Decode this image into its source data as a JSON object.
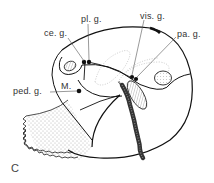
{
  "figure": {
    "panel_label": "C",
    "labels": {
      "pl_g": "pl. g.",
      "ce_g": "ce. g.",
      "vis_g": "vis. g.",
      "pa_g": "pa. g.",
      "ped_g": "ped. g.",
      "m": "M."
    }
  }
}
